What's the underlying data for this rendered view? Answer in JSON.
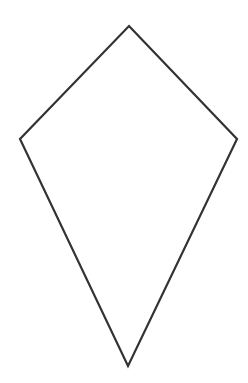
{
  "diagram": {
    "shape": "kite",
    "background_color": "#ffffff",
    "stroke_color": "#333333",
    "stroke_width": 2.2,
    "fill": "none",
    "vertices": [
      {
        "name": "top",
        "x": 129,
        "y": 26
      },
      {
        "name": "right",
        "x": 237,
        "y": 139
      },
      {
        "name": "bottom",
        "x": 128,
        "y": 366
      },
      {
        "name": "left",
        "x": 20,
        "y": 139
      }
    ]
  }
}
